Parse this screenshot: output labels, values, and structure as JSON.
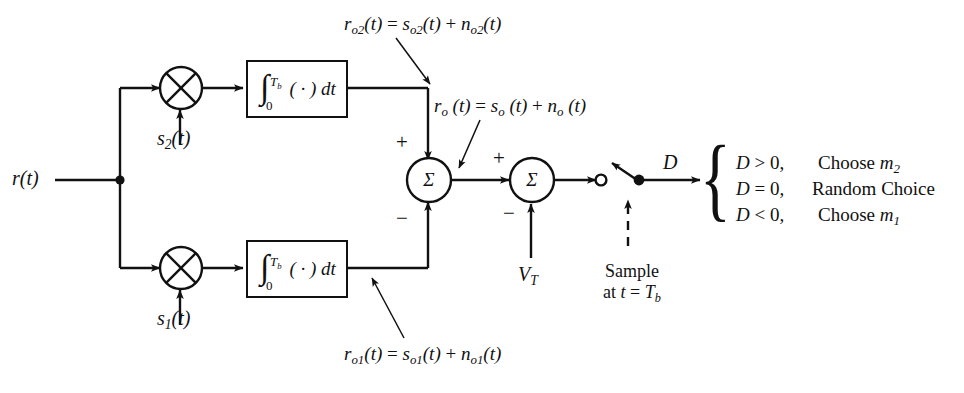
{
  "diagram": {
    "input_label": "r(t)",
    "branches": [
      {
        "id": "upper",
        "multiplier_icon": "multiplier-x-circle",
        "reference_signal": "s",
        "reference_sub": "2",
        "reference_suffix": "(t)",
        "integrator": {
          "symbol": "∫",
          "upper_limit": "T",
          "upper_limit_sub": "b",
          "lower_limit": "0",
          "integrand": "( · )",
          "differential": "dt"
        },
        "output_annotation": "r_o2(t) = s_o2(t) + n_o2(t)",
        "sum_sign": "+"
      },
      {
        "id": "lower",
        "multiplier_icon": "multiplier-x-circle",
        "reference_signal": "s",
        "reference_sub": "1",
        "reference_suffix": "(t)",
        "integrator": {
          "symbol": "∫",
          "upper_limit": "T",
          "upper_limit_sub": "b",
          "lower_limit": "0",
          "integrand": "( · )",
          "differential": "dt"
        },
        "output_annotation": "r_o1(t) = s_o1(t) + n_o1(t)",
        "sum_sign": "−"
      }
    ],
    "summers": [
      {
        "id": "sum1",
        "symbol": "Σ",
        "plus": "+",
        "minus": "−"
      },
      {
        "id": "sum2",
        "symbol": "Σ",
        "plus": "+",
        "minus": "−"
      }
    ],
    "mid_annotation": "r_o (t) = s_o (t) + n_o (t)",
    "threshold_label": "V",
    "threshold_sub": "T",
    "sample_label_line1": "Sample",
    "sample_label_line2": "at t = T",
    "sample_label_line2_sub": "b",
    "decision_variable": "D",
    "decision_rules": [
      {
        "condition": "D > 0,",
        "action": "Choose m",
        "action_sub": "2"
      },
      {
        "condition": "D = 0,",
        "action": "Random Choice",
        "action_sub": ""
      },
      {
        "condition": "D < 0,",
        "action": "Choose m",
        "action_sub": "1"
      }
    ],
    "brace_glyph": "{",
    "colors": {
      "ink": "#111111",
      "background": "#ffffff"
    }
  }
}
